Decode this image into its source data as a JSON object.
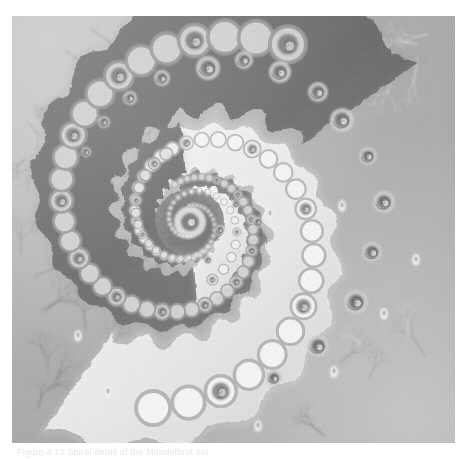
{
  "figure": {
    "kind": "fractal-image",
    "rendering": "grayscale escape-time"
  },
  "caption": {
    "text": "Figure 4.13  Spiral detail of the Mandelbrot set"
  },
  "canvas": {
    "width": 469,
    "height": 459,
    "image_left": 12,
    "image_top": 16,
    "image_width": 443,
    "image_height": 427,
    "background": "#ffffff"
  },
  "palette": {
    "paper_white": "#ffffff",
    "highlight": "#f4f4f4",
    "light_band": "#e8e8e8",
    "mid_light": "#c8c8c8",
    "mid": "#a6a6a6",
    "mid_dark": "#8a8a8a",
    "arm_dark": "#6e6e6e",
    "arm_darker": "#5a5a5a",
    "deep": "#4a4a4a",
    "filament": "#7a7a7a",
    "island": "#f0f0f0"
  },
  "structure": {
    "spiral_center_x": 178,
    "spiral_center_y": 206,
    "spiral_turns": 2.6,
    "outer_arm_radius": 205,
    "inner_core_radius": 9,
    "bulb_chain_count": 46,
    "filament_count": 58,
    "island_count": 9
  },
  "chart_data": {
    "type": "heatmap",
    "xlabel": "Re(c)",
    "ylabel": "Im(c)",
    "colormap": "grayscale",
    "spiral_arms": [
      {
        "name": "dark-arm-outer",
        "shade": "#6e6e6e",
        "start_angle": -105,
        "sweep": 430,
        "start_radius": 34,
        "end_radius": 208,
        "width_factor": 0.34
      },
      {
        "name": "light-arm-outer",
        "shade": "#ededed",
        "start_angle": 55,
        "sweep": 430,
        "start_radius": 26,
        "end_radius": 196,
        "width_factor": 0.3
      },
      {
        "name": "dark-arm-inner",
        "shade": "#747474",
        "start_angle": -95,
        "sweep": 360,
        "start_radius": 12,
        "end_radius": 74,
        "width_factor": 0.36
      },
      {
        "name": "light-arm-inner",
        "shade": "#efefef",
        "start_angle": 85,
        "sweep": 360,
        "start_radius": 10,
        "end_radius": 64,
        "width_factor": 0.32
      }
    ],
    "background_levels": [
      {
        "region": "upper-left-corner",
        "value": 246
      },
      {
        "region": "upper-right-field",
        "value": 170
      },
      {
        "region": "right-dark-arm",
        "value": 108
      },
      {
        "region": "lower-left-field",
        "value": 158
      },
      {
        "region": "lower-right-bright",
        "value": 212
      },
      {
        "region": "spiral-core",
        "value": 132
      }
    ]
  }
}
